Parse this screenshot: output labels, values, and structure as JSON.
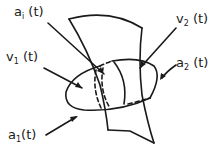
{
  "diagram": {
    "labels": {
      "a_i": {
        "base": "a",
        "sub": "i",
        "arg": " (t)"
      },
      "v_1": {
        "base": "v",
        "sub": "1",
        "arg": " (t)"
      },
      "v_2": {
        "base": "v",
        "sub": "2",
        "arg": " (t)"
      },
      "a_2": {
        "base": "a",
        "sub": "2",
        "arg": " (t)"
      },
      "a_1": {
        "base": "a",
        "sub": "1",
        "arg": "(t)"
      }
    },
    "stroke_color": "#1a1a1a",
    "background": "#ffffff"
  }
}
